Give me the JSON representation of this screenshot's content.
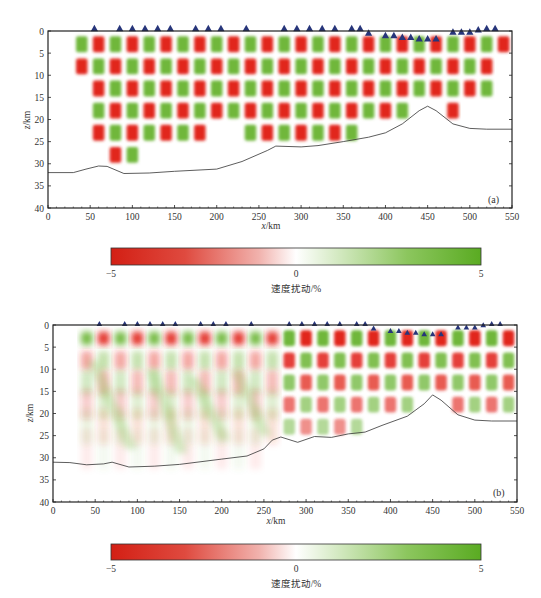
{
  "chart_data": [
    {
      "type": "heatmap",
      "panel_label": "(a)",
      "title": "",
      "xlabel_var": "x",
      "xlabel_unit": "/km",
      "ylabel_var": "z",
      "ylabel_unit": "/km",
      "xlim": [
        0,
        550
      ],
      "ylim": [
        0,
        40
      ],
      "y_inverted": true,
      "xticks": [
        0,
        50,
        100,
        150,
        200,
        250,
        300,
        350,
        400,
        450,
        500,
        550
      ],
      "yticks": [
        0,
        5,
        10,
        15,
        20,
        25,
        30,
        35,
        40
      ],
      "pattern": "checkerboard",
      "checker_size_km": 20,
      "checker_depth_km": 5,
      "amplitude_pct": 5,
      "recovered_region_top_km": 0,
      "recovered_region_bottom_x": [
        30,
        60,
        90,
        120,
        150,
        180,
        210,
        240,
        270,
        300,
        330,
        360,
        390,
        420,
        450,
        480,
        510,
        540
      ],
      "recovered_region_bottom_z": [
        2,
        27,
        29,
        27,
        28,
        27,
        20,
        27,
        27,
        26,
        25,
        24,
        22,
        19,
        17,
        19,
        17,
        6
      ],
      "moho_x": [
        0,
        30,
        45,
        60,
        70,
        90,
        120,
        150,
        200,
        230,
        260,
        270,
        300,
        320,
        350,
        380,
        400,
        420,
        440,
        450,
        460,
        480,
        500,
        520,
        550
      ],
      "moho_z": [
        32,
        32,
        31.2,
        30.5,
        30.6,
        32.2,
        32.1,
        31.7,
        31.2,
        29.5,
        27,
        26,
        26.2,
        25.9,
        25,
        24,
        23,
        21,
        18,
        17,
        18,
        21,
        22,
        22.2,
        22.2
      ],
      "stations_x": [
        55,
        85,
        100,
        115,
        130,
        145,
        175,
        190,
        205,
        235,
        280,
        295,
        310,
        325,
        340,
        360,
        370,
        380,
        400,
        410,
        420,
        430,
        440,
        450,
        460,
        480,
        490,
        500,
        510,
        520,
        530
      ],
      "stations_z": [
        0,
        0,
        0,
        0,
        0,
        0,
        0,
        0,
        0,
        0,
        0,
        0,
        0,
        0,
        0,
        0,
        0,
        1,
        1.6,
        1.6,
        2,
        2,
        2.3,
        2.3,
        2.3,
        0.8,
        0.8,
        0.8,
        0.3,
        0,
        0
      ]
    },
    {
      "type": "heatmap",
      "panel_label": "(b)",
      "title": "",
      "xlabel_var": "x",
      "xlabel_unit": "/km",
      "ylabel_var": "z",
      "ylabel_unit": "/km",
      "xlim": [
        0,
        550
      ],
      "ylim": [
        0,
        40
      ],
      "y_inverted": true,
      "xticks": [
        0,
        50,
        100,
        150,
        200,
        250,
        300,
        350,
        400,
        450,
        500,
        550
      ],
      "yticks": [
        0,
        5,
        10,
        15,
        20,
        25,
        30,
        35,
        40
      ],
      "pattern": "smeared-checkerboard",
      "checker_size_km": 20,
      "checker_depth_km": 5,
      "amplitude_pct": 5,
      "moho_x": [
        0,
        20,
        40,
        60,
        70,
        90,
        120,
        150,
        200,
        230,
        250,
        260,
        270,
        290,
        310,
        330,
        350,
        370,
        390,
        420,
        440,
        450,
        460,
        480,
        500,
        520,
        550
      ],
      "moho_z": [
        31,
        31.1,
        31.6,
        31.4,
        31,
        32.1,
        31.9,
        31.5,
        30.3,
        29.6,
        28,
        26,
        25.3,
        26.5,
        25.2,
        25.4,
        24.6,
        24.2,
        22.7,
        20.6,
        17.8,
        15.8,
        17,
        20.3,
        21.5,
        21.7,
        21.7
      ],
      "stations_x": [
        55,
        85,
        100,
        115,
        130,
        145,
        175,
        190,
        205,
        235,
        280,
        295,
        310,
        325,
        340,
        360,
        370,
        380,
        400,
        410,
        420,
        430,
        440,
        450,
        460,
        480,
        490,
        500,
        510,
        520,
        530
      ],
      "stations_z": [
        0,
        0,
        0,
        0,
        0,
        0,
        0,
        0,
        0,
        0,
        0,
        0,
        0,
        0,
        0,
        0,
        0,
        1,
        1.6,
        1.6,
        2,
        2,
        2.3,
        2.3,
        2.3,
        0.8,
        0.8,
        0.8,
        0.3,
        0,
        0
      ]
    }
  ],
  "colorbar": {
    "min": -5,
    "max": 5,
    "ticks": [
      "−5",
      "0",
      "5"
    ],
    "label": "速度扰动/%",
    "low_color": "#d9261c",
    "mid_color": "#ffffff",
    "high_color": "#5fae2a"
  },
  "colors": {
    "station": "#27357a",
    "moho": "#333333",
    "axis": "#222222"
  }
}
